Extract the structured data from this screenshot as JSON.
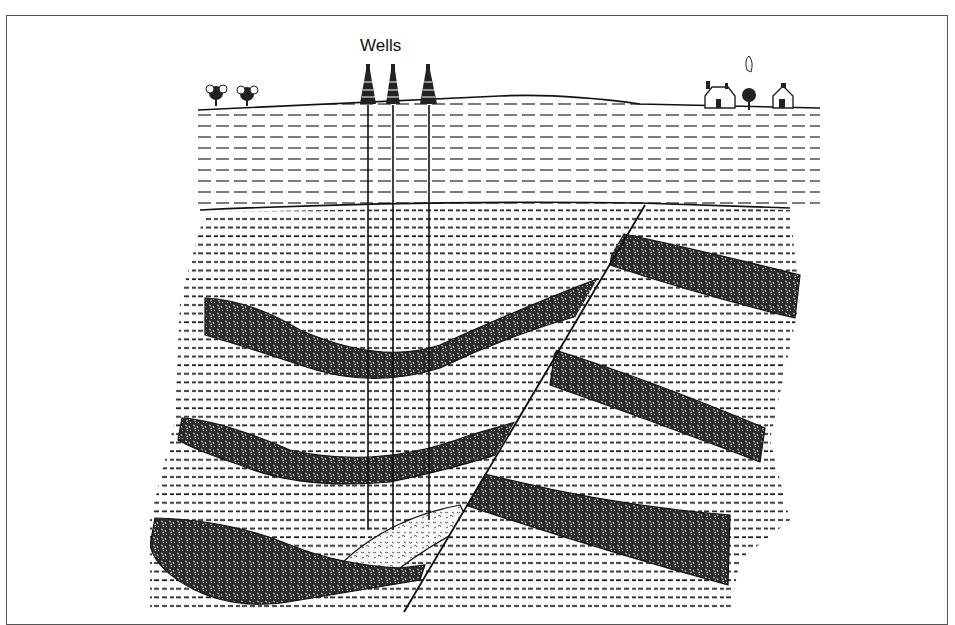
{
  "diagram": {
    "title": "Wells",
    "type": "geological cross-section",
    "colors": {
      "line": "#111111",
      "shale_dash": "#222222",
      "sandstone": "#2a2a2a",
      "background": "#ffffff"
    },
    "surface_features": {
      "left": "trees",
      "center": "three oil well derricks",
      "right": "houses and trees"
    },
    "wells": [
      {
        "label": "well-1",
        "x": 368
      },
      {
        "label": "well-2",
        "x": 393
      },
      {
        "label": "well-3",
        "x": 429
      }
    ],
    "layers": [
      {
        "name": "surface-sediment",
        "pattern": "long dashes"
      },
      {
        "name": "shale",
        "pattern": "short dashes"
      },
      {
        "name": "sandstone-bed",
        "pattern": "stippled dark",
        "count_left_block": 3,
        "count_right_block": 3
      },
      {
        "name": "oil-reservoir",
        "pattern": "light hatched"
      }
    ],
    "structure": {
      "fault": "normal fault, diagonal",
      "trap": "fault trap against lowest bed"
    }
  }
}
